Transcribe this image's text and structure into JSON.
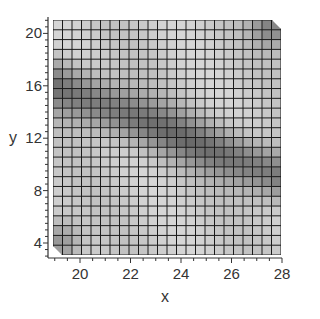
{
  "chart_data": {
    "type": "heatmap",
    "title": "",
    "xlabel": "x",
    "ylabel": "y",
    "xlim": [
      18.9,
      28
    ],
    "ylim": [
      2.9,
      21.2
    ],
    "x_ticks": [
      20,
      22,
      24,
      26,
      28
    ],
    "y_ticks": [
      4,
      8,
      12,
      16,
      20
    ],
    "grid": {
      "columns": 24,
      "rows": 24,
      "line_color": "#1a1a1a"
    },
    "colormap": "grayscale",
    "features": [
      {
        "name": "dark-band",
        "from": [
          19,
          16
        ],
        "to": [
          28,
          9
        ],
        "intensity": 0.35
      },
      {
        "name": "dark-corner-lower-left",
        "center": [
          19.2,
          4
        ],
        "intensity": 0.25
      },
      {
        "name": "dark-corner-upper-right",
        "center": [
          27.6,
          20.6
        ],
        "intensity": 0.3
      }
    ]
  },
  "axes": {
    "x_label": "x",
    "y_label": "y",
    "x_tick_labels": [
      "20",
      "22",
      "24",
      "26",
      "28"
    ],
    "y_tick_labels": [
      "4",
      "8",
      "12",
      "16",
      "20"
    ]
  }
}
